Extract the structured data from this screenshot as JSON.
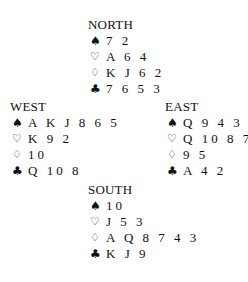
{
  "diagram": {
    "type": "bridge-deal",
    "suit_symbols": {
      "spades": "♠",
      "hearts": "♡",
      "diamonds": "♢",
      "clubs": "♣"
    },
    "hands": {
      "north": {
        "label": "NORTH",
        "spades": "7 2",
        "hearts": "A 6 4",
        "diamonds": "K J 6 2",
        "clubs": "7 6 5 3"
      },
      "west": {
        "label": "WEST",
        "spades": "A K J 8 6 5",
        "hearts": "K 9 2",
        "diamonds": "10",
        "clubs": "Q 10 8"
      },
      "east": {
        "label": "EAST",
        "spades": "Q 9 4 3",
        "hearts": "Q 10 8 7",
        "diamonds": "9 5",
        "clubs": "A 4 2"
      },
      "south": {
        "label": "SOUTH",
        "spades": "10",
        "hearts": "J 5 3",
        "diamonds": "A Q 8 7 4 3",
        "clubs": "K J 9"
      }
    }
  }
}
